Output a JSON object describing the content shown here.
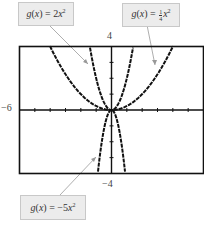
{
  "labels": {
    "top_left": {
      "prefix": "g(x) = 2x",
      "exp": "2"
    },
    "top_right": {
      "prefix": "g(x) = ",
      "frac_num": "1",
      "frac_den": "4",
      "var": "x",
      "exp": "2"
    },
    "bottom": {
      "prefix": "g(x) = −5x",
      "exp": "2"
    }
  },
  "axes": {
    "y_max": "4",
    "y_min": "−4",
    "x_min": "−6"
  },
  "colors": {
    "curve": "#111111",
    "leader": "#999999",
    "box_bg": "#ececec"
  },
  "chart_data": {
    "type": "line",
    "title": "",
    "xlabel": "",
    "ylabel": "",
    "xlim": [
      -6,
      6
    ],
    "ylim": [
      -4,
      4
    ],
    "series": [
      {
        "name": "g(x) = 2x^2",
        "function": "2x^2"
      },
      {
        "name": "g(x) = (1/4)x^2",
        "function": "0.25x^2"
      },
      {
        "name": "g(x) = -5x^2",
        "function": "-5x^2"
      }
    ],
    "tick_spacing": 1
  }
}
